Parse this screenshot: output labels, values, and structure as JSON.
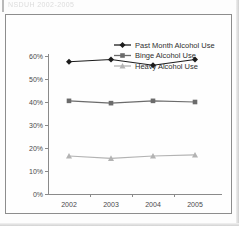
{
  "scan": {
    "header_ghost_text": "NSDUH 2002-2005"
  },
  "chart_data": {
    "type": "line",
    "title": "",
    "xlabel": "Year",
    "ylabel": "",
    "categories": [
      "2002",
      "2003",
      "2004",
      "2005"
    ],
    "x": [
      2002,
      2003,
      2004,
      2005
    ],
    "ylim": [
      0,
      60
    ],
    "ytick_labels": [
      "0%",
      "10%",
      "20%",
      "30%",
      "40%",
      "50%",
      "60%"
    ],
    "ytick_values": [
      0,
      10,
      20,
      30,
      40,
      50,
      60
    ],
    "xtick_labels": [
      "2002",
      "2003",
      "2004",
      "2005"
    ],
    "grid": false,
    "legend_position": "top-right",
    "value_suffix": "%",
    "series": [
      {
        "name": "Past Month Alcohol Use",
        "values": [
          57.5,
          58.5,
          56.0,
          58.5
        ],
        "color": "#1c1c1c",
        "marker": "diamond"
      },
      {
        "name": "Binge Alcohol Use",
        "values": [
          40.5,
          39.5,
          40.5,
          40.0
        ],
        "color": "#6b6b6b",
        "marker": "square"
      },
      {
        "name": "Heavy Alcohol Use",
        "values": [
          16.5,
          15.5,
          16.5,
          17.0
        ],
        "color": "#b3b3b3",
        "marker": "triangle"
      }
    ]
  }
}
